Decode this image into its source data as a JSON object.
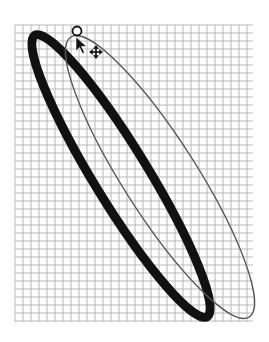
{
  "canvas": {
    "width": 269,
    "height": 342,
    "background": "#ffffff",
    "grid": {
      "x": 15,
      "y": 25,
      "width": 238,
      "height": 297,
      "cell": 8,
      "line_color": "#b8b8b8",
      "major_every": 0
    },
    "shapes": [
      {
        "name": "selected-ellipse-thick",
        "cx": 121,
        "cy": 176,
        "rx": 165,
        "ry": 27,
        "rotate": 58.5,
        "stroke": "#111111",
        "stroke_width": 9
      },
      {
        "name": "ghost-ellipse-thin",
        "cx": 160,
        "cy": 177,
        "rx": 166,
        "ry": 37,
        "rotate": 57.5,
        "stroke": "#555555",
        "stroke_width": 1.3
      }
    ],
    "cursor": {
      "rotate_handle": {
        "cx": 77,
        "cy": 31,
        "r": 4.5
      },
      "pointer": {
        "x": 76,
        "y": 37
      },
      "move_icon": {
        "x": 96,
        "y": 52
      }
    }
  }
}
